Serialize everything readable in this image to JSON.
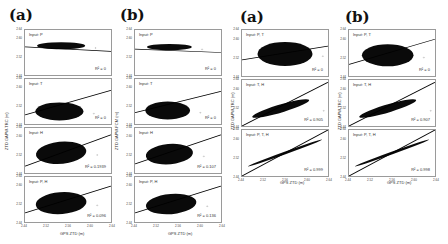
{
  "figure": {
    "groups": [
      {
        "label": "(a)",
        "ylabel": "ZTD GAPW-TRC (m)",
        "xlabel": "GPS ZTD (m)"
      },
      {
        "label": "(b)",
        "ylabel": "ZTD GAPW-FCM (m)",
        "xlabel": "GPS ZTD (m)"
      },
      {
        "label": "(a)",
        "ylabel": "ZTD GAPW-TRC (m)",
        "xlabel": "GPS ZTD (m)"
      },
      {
        "label": "(b)",
        "ylabel": "ZTD GAPW-TRC (m)",
        "xlabel": "GPS ZTD (m)"
      }
    ],
    "yticks": [
      "2.44",
      "2.48",
      "2.52",
      "2.56",
      "2.60",
      "2.64"
    ],
    "xticks": [
      "2.44",
      "2.52",
      "2.56",
      "2.60",
      "2.64"
    ]
  },
  "chart_data": [
    {
      "type": "scatter",
      "group": "(a)",
      "title": "Input: P",
      "r2_label": "R² = 0",
      "r2": 0,
      "xlabel": "GPS ZTD (m)",
      "ylabel": "ZTD GAPW-TRC (m)",
      "xlim": [
        2.44,
        2.64
      ],
      "ylim": [
        2.44,
        2.64
      ],
      "fit": {
        "y0": 2.565,
        "y1": 2.545
      }
    },
    {
      "type": "scatter",
      "group": "(a)",
      "title": "Input: T",
      "r2_label": "R² = 0",
      "r2": 0,
      "xlabel": "GPS ZTD (m)",
      "ylabel": "ZTD GAPW-TRC (m)",
      "xlim": [
        2.44,
        2.64
      ],
      "ylim": [
        2.44,
        2.64
      ],
      "fit": {
        "y0": 2.48,
        "y1": 2.59
      }
    },
    {
      "type": "scatter",
      "group": "(a)",
      "title": "Input: H",
      "r2_label": "R² = 0.1939",
      "r2": 0.1939,
      "xlabel": "GPS ZTD (m)",
      "ylabel": "ZTD GAPW-TRC (m)",
      "xlim": [
        2.44,
        2.64
      ],
      "ylim": [
        2.44,
        2.64
      ],
      "fit": {
        "y0": 2.47,
        "y1": 2.61
      }
    },
    {
      "type": "scatter",
      "group": "(a)",
      "title": "Input: P, H",
      "r2_label": "R² = 0.096",
      "r2": 0.096,
      "xlabel": "GPS ZTD (m)",
      "ylabel": "ZTD GAPW-TRC (m)",
      "xlim": [
        2.44,
        2.64
      ],
      "ylim": [
        2.44,
        2.64
      ],
      "fit": {
        "y0": 2.48,
        "y1": 2.6
      }
    },
    {
      "type": "scatter",
      "group": "(b)",
      "title": "Input: P",
      "r2_label": "R² = 0",
      "r2": 0,
      "xlabel": "GPS ZTD (m)",
      "ylabel": "ZTD GAPW-FCM (m)",
      "xlim": [
        2.44,
        2.64
      ],
      "ylim": [
        2.44,
        2.64
      ],
      "fit": {
        "y0": 2.555,
        "y1": 2.54
      }
    },
    {
      "type": "scatter",
      "group": "(b)",
      "title": "Input: T",
      "r2_label": "R² = 0",
      "r2": 0,
      "xlabel": "GPS ZTD (m)",
      "ylabel": "ZTD GAPW-FCM (m)",
      "xlim": [
        2.44,
        2.64
      ],
      "ylim": [
        2.44,
        2.64
      ],
      "fit": {
        "y0": 2.49,
        "y1": 2.585
      }
    },
    {
      "type": "scatter",
      "group": "(b)",
      "title": "Input: H",
      "r2_label": "R² = 0.107",
      "r2": 0.107,
      "xlabel": "GPS ZTD (m)",
      "ylabel": "ZTD GAPW-FCM (m)",
      "xlim": [
        2.44,
        2.64
      ],
      "ylim": [
        2.44,
        2.64
      ],
      "fit": {
        "y0": 2.48,
        "y1": 2.61
      }
    },
    {
      "type": "scatter",
      "group": "(b)",
      "title": "Input: P, H",
      "r2_label": "R² = 0.136",
      "r2": 0.136,
      "xlabel": "GPS ZTD (m)",
      "ylabel": "ZTD GAPW-FCM (m)",
      "xlim": [
        2.44,
        2.64
      ],
      "ylim": [
        2.44,
        2.64
      ],
      "fit": {
        "y0": 2.48,
        "y1": 2.6
      }
    },
    {
      "type": "scatter",
      "group": "(a)",
      "title": "Input: P, T",
      "r2_label": "R² = 0",
      "r2": 0,
      "xlabel": "GPS ZTD (m)",
      "ylabel": "ZTD GAPW-TRC (m)",
      "xlim": [
        2.44,
        2.64
      ],
      "ylim": [
        2.44,
        2.64
      ],
      "fit": {
        "y0": 2.51,
        "y1": 2.57
      }
    },
    {
      "type": "scatter",
      "group": "(a)",
      "title": "Input: T, H",
      "r2_label": "R² = 0.905",
      "r2": 0.905,
      "xlabel": "GPS ZTD (m)",
      "ylabel": "ZTD GAPW-TRC (m)",
      "xlim": [
        2.44,
        2.64
      ],
      "ylim": [
        2.44,
        2.64
      ],
      "fit": {
        "y0": 2.44,
        "y1": 2.63
      }
    },
    {
      "type": "scatter",
      "group": "(a)",
      "title": "Input: P, T, H",
      "r2_label": "R² = 0.999",
      "r2": 0.999,
      "xlabel": "GPS ZTD (m)",
      "ylabel": "ZTD GAPW-TRC (m)",
      "xlim": [
        2.44,
        2.64
      ],
      "ylim": [
        2.44,
        2.64
      ],
      "fit": {
        "y0": 2.44,
        "y1": 2.64
      }
    },
    {
      "type": "scatter",
      "group": "(b)",
      "title": "Input: P, T",
      "r2_label": "R² = 0",
      "r2": 0,
      "xlabel": "GPS ZTD (m)",
      "ylabel": "ZTD GAPW-TRC (m)",
      "xlim": [
        2.44,
        2.64
      ],
      "ylim": [
        2.44,
        2.64
      ],
      "fit": {
        "y0": 2.49,
        "y1": 2.6
      }
    },
    {
      "type": "scatter",
      "group": "(b)",
      "title": "Input: T, H",
      "r2_label": "R² = 0.907",
      "r2": 0.907,
      "xlabel": "GPS ZTD (m)",
      "ylabel": "ZTD GAPW-TRC (m)",
      "xlim": [
        2.44,
        2.64
      ],
      "ylim": [
        2.44,
        2.64
      ],
      "fit": {
        "y0": 2.44,
        "y1": 2.63
      }
    },
    {
      "type": "scatter",
      "group": "(b)",
      "title": "Input: P, T, H",
      "r2_label": "R² = 0.998",
      "r2": 0.998,
      "xlabel": "GPS ZTD (m)",
      "ylabel": "ZTD GAPW-TRC (m)",
      "xlim": [
        2.44,
        2.64
      ],
      "ylim": [
        2.44,
        2.64
      ],
      "fit": {
        "y0": 2.44,
        "y1": 2.64
      }
    }
  ]
}
